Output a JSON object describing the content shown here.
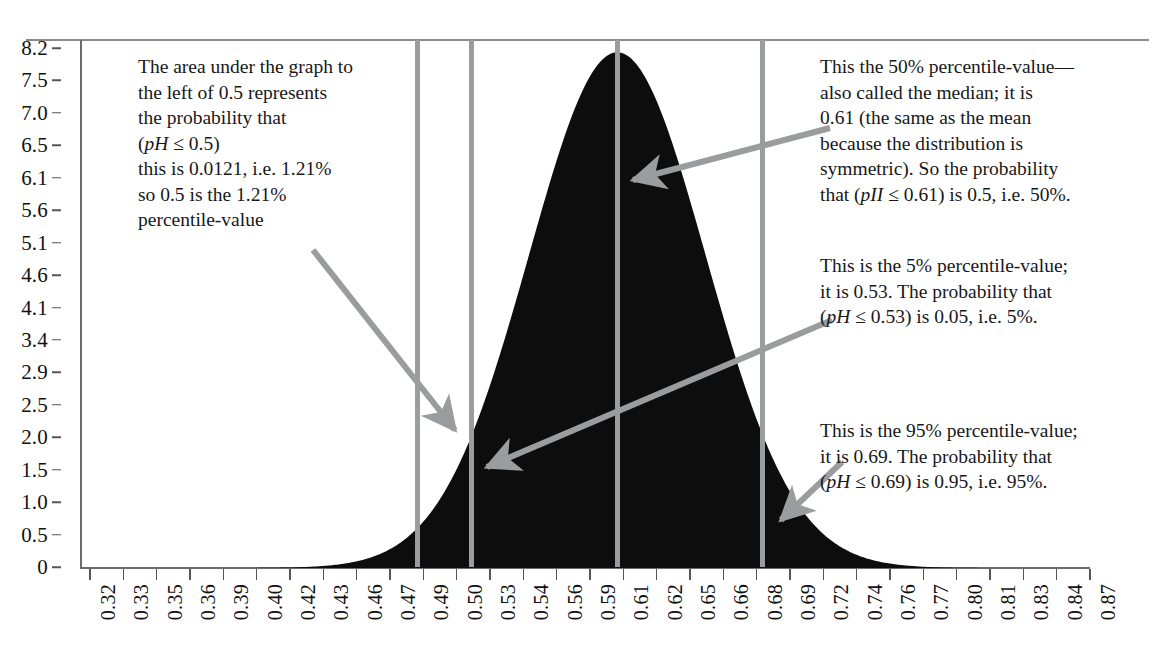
{
  "chart_data": {
    "type": "area",
    "title": "",
    "xlabel": "",
    "ylabel": "",
    "xlim": [
      0.32,
      0.87
    ],
    "ylim": [
      0,
      8.6
    ],
    "grid": false,
    "legend": "none",
    "x_tick_labels": [
      "0.32",
      "0.33",
      "0.35",
      "0.36",
      "0.39",
      "0.40",
      "0.42",
      "0.43",
      "0.46",
      "0.47",
      "0.49",
      "0.50",
      "0.53",
      "0.54",
      "0.56",
      "0.59",
      "0.61",
      "0.62",
      "0.65",
      "0.66",
      "0.68",
      "0.69",
      "0.72",
      "0.74",
      "0.76",
      "0.77",
      "0.80",
      "0.81",
      "0.83",
      "0.84",
      "0.87"
    ],
    "y_tick_labels": [
      "8.2",
      "7.5",
      "7.0",
      "6.5",
      "6.1",
      "5.6",
      "5.1",
      "4.6",
      "4.1",
      "3.4",
      "2.9",
      "2.5",
      "2.0",
      "1.5",
      "1.0",
      "0.5",
      "0"
    ],
    "y_tick_values": [
      8.2,
      7.5,
      7.0,
      6.5,
      6.1,
      5.6,
      5.1,
      4.6,
      4.1,
      3.4,
      2.9,
      2.5,
      2.0,
      1.5,
      1.0,
      0.5,
      0
    ],
    "distribution": {
      "mean": 0.61,
      "std": 0.0486,
      "peak_value": 8.4
    },
    "series": [
      {
        "name": "pH probability density",
        "x": [
          0.32,
          0.33,
          0.34,
          0.35,
          0.36,
          0.37,
          0.38,
          0.39,
          0.4,
          0.41,
          0.42,
          0.43,
          0.44,
          0.45,
          0.46,
          0.47,
          0.48,
          0.49,
          0.5,
          0.51,
          0.52,
          0.53,
          0.54,
          0.55,
          0.56,
          0.57,
          0.58,
          0.59,
          0.6,
          0.61,
          0.62,
          0.63,
          0.64,
          0.65,
          0.66,
          0.67,
          0.68,
          0.69,
          0.7,
          0.71,
          0.72,
          0.73,
          0.74,
          0.75,
          0.76,
          0.77,
          0.78,
          0.79,
          0.8,
          0.81,
          0.82,
          0.83,
          0.84,
          0.85,
          0.86,
          0.87
        ],
        "y": [
          0.0,
          0.0,
          0.01,
          0.02,
          0.04,
          0.07,
          0.13,
          0.22,
          0.37,
          0.59,
          0.91,
          1.34,
          1.91,
          2.61,
          3.44,
          4.35,
          5.29,
          6.18,
          6.96,
          7.56,
          7.95,
          8.1,
          7.95,
          7.56,
          6.96,
          6.18,
          5.29,
          4.35,
          3.44,
          8.4,
          7.95,
          7.56,
          6.96,
          6.18,
          5.29,
          4.35,
          3.44,
          2.61,
          1.91,
          1.34,
          0.91,
          0.59,
          0.37,
          0.22,
          0.13,
          0.07,
          0.04,
          0.02,
          0.01,
          0.0,
          0.0,
          0.0,
          0.0,
          0.0,
          0.0,
          0.0
        ]
      }
    ],
    "markers": [
      {
        "name": "1.21-percentile-line",
        "x": 0.5,
        "label": "0.50",
        "percentile": 1.21,
        "probability": 0.0121
      },
      {
        "name": "5-percentile-line",
        "x": 0.53,
        "label": "0.53",
        "percentile": 5,
        "probability": 0.05
      },
      {
        "name": "50-percentile-line",
        "x": 0.61,
        "label": "0.61",
        "percentile": 50,
        "probability": 0.5
      },
      {
        "name": "95-percentile-line",
        "x": 0.69,
        "label": "0.69",
        "percentile": 95,
        "probability": 0.95
      }
    ]
  },
  "colors": {
    "density_fill": "#0d0d0d",
    "marker_line": "#9b9c9e",
    "arrow": "#9b9c9e",
    "axis": "#6a6b6e",
    "text": "#17181a",
    "background": "#ffffff"
  },
  "annotations": {
    "left_1_21": {
      "lines": [
        "The area under the graph to",
        "the left of 0.5 represents",
        "the probability that",
        "(pH ≤ 0.5)",
        "this is 0.0121, i.e. 1.21%",
        "so 0.5 is the 1.21%",
        "percentile-value"
      ],
      "italic_token": "pH"
    },
    "median_50": {
      "lines": [
        "This the 50% percentile-value—",
        "also called the median; it is",
        "0.61 (the same as the mean",
        "because the distribution is",
        "symmetric). So the probability",
        "that (pII ≤ 0.61) is 0.5, i.e. 50%."
      ],
      "italic_token": "pII"
    },
    "percentile_5": {
      "lines": [
        "This is the 5% percentile-value;",
        "it is 0.53. The probability that",
        "(pH ≤ 0.53) is 0.05, i.e. 5%."
      ],
      "italic_token": "pH"
    },
    "percentile_95": {
      "lines": [
        "This is the 95% percentile-value;",
        "it is 0.69. The probability that",
        "(pH ≤ 0.69) is 0.95, i.e. 95%."
      ],
      "italic_token": "pH"
    }
  }
}
